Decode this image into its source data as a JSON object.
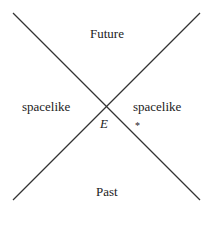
{
  "diagram": {
    "type": "light-cone",
    "labels": {
      "future": "Future",
      "past": "Past",
      "spacelike_left": "spacelike",
      "spacelike_right": "spacelike",
      "event": "E"
    },
    "marker": "*",
    "line_color": "#333333"
  }
}
